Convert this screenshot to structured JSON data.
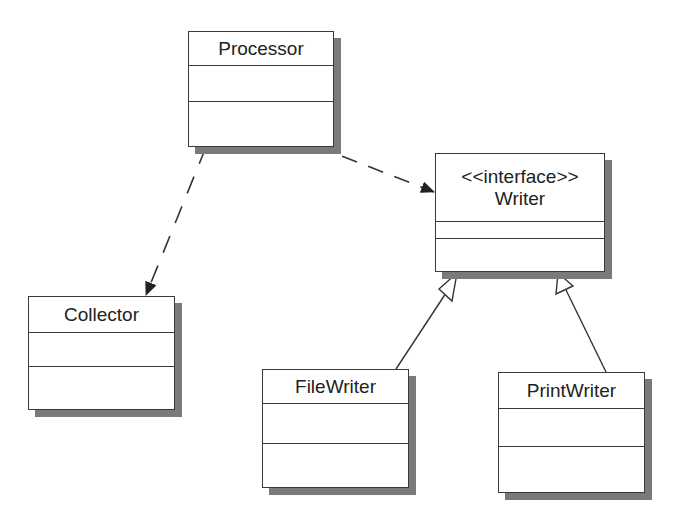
{
  "diagram": {
    "type": "UML class diagram",
    "classes": [
      {
        "id": "processor",
        "name": "Processor",
        "stereotype": "",
        "attributes": [],
        "operations": []
      },
      {
        "id": "writer",
        "name": "Writer",
        "stereotype": "<<interface>>",
        "attributes": [],
        "operations": []
      },
      {
        "id": "collector",
        "name": "Collector",
        "stereotype": "",
        "attributes": [],
        "operations": []
      },
      {
        "id": "filewriter",
        "name": "FileWriter",
        "stereotype": "",
        "attributes": [],
        "operations": []
      },
      {
        "id": "printwriter",
        "name": "PrintWriter",
        "stereotype": "",
        "attributes": [],
        "operations": []
      }
    ],
    "relationships": [
      {
        "type": "dependency",
        "from": "Processor",
        "to": "Writer",
        "style": "dashed",
        "arrowhead": "filled"
      },
      {
        "type": "dependency",
        "from": "Processor",
        "to": "Collector",
        "style": "dashed",
        "arrowhead": "filled"
      },
      {
        "type": "generalization",
        "from": "FileWriter",
        "to": "Writer",
        "style": "solid",
        "arrowhead": "hollow-triangle"
      },
      {
        "type": "generalization",
        "from": "PrintWriter",
        "to": "Writer",
        "style": "solid",
        "arrowhead": "hollow-triangle"
      }
    ]
  },
  "colors": {
    "line": "#3a3a3a",
    "shadow": "#7a7a7a",
    "background": "#ffffff"
  }
}
